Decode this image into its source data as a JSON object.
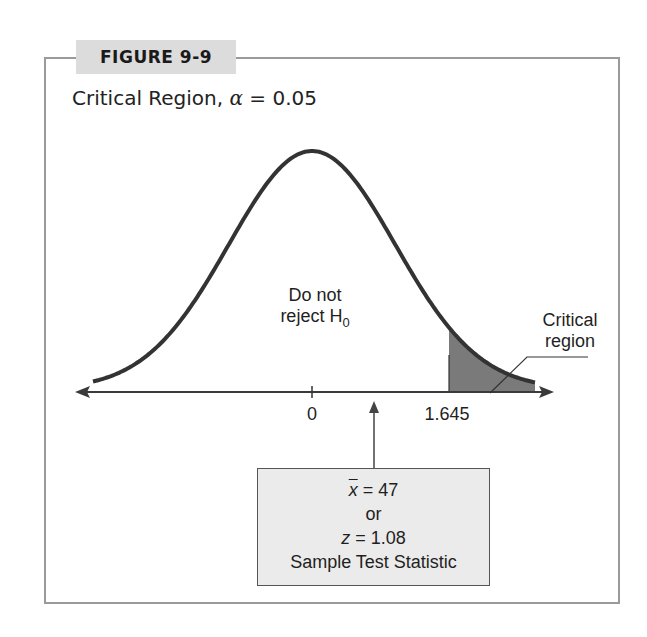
{
  "figure": {
    "label": "FIGURE 9-9",
    "title_prefix": "Critical Region, ",
    "title_alpha": "α",
    "title_suffix": " = 0.05"
  },
  "annotations": {
    "acceptance_line1": "Do not",
    "acceptance_line2": "reject H",
    "acceptance_sub": "0",
    "critical_line1": "Critical",
    "critical_line2": "region",
    "tick_zero": "0",
    "tick_critical": "1.645"
  },
  "stat_box": {
    "xbar_symbol": "x",
    "xbar_value": " = 47",
    "or_text": "or",
    "z_symbol": "z",
    "z_value": " = 1.08",
    "caption": "Sample Test Statistic"
  },
  "colors": {
    "curve": "#333333",
    "shade": "#7a7a7a",
    "frame": "#9a9a9a",
    "label_bg": "#dcdcdc",
    "box_bg": "#ebebeb"
  },
  "chart_data": {
    "type": "area",
    "title": "Critical Region, α = 0.05",
    "distribution": "standard normal",
    "xlabel": "z",
    "ylabel": "",
    "x_ticks": [
      0,
      1.645
    ],
    "alpha": 0.05,
    "critical_value": 1.645,
    "tail": "right",
    "shaded_region": {
      "from": 1.645,
      "to": "+inf",
      "label": "Critical region"
    },
    "acceptance_region_label": "Do not reject H0",
    "test_statistic": {
      "xbar": 47,
      "z": 1.08,
      "label": "Sample Test Statistic"
    },
    "grid": false,
    "legend": "none"
  }
}
